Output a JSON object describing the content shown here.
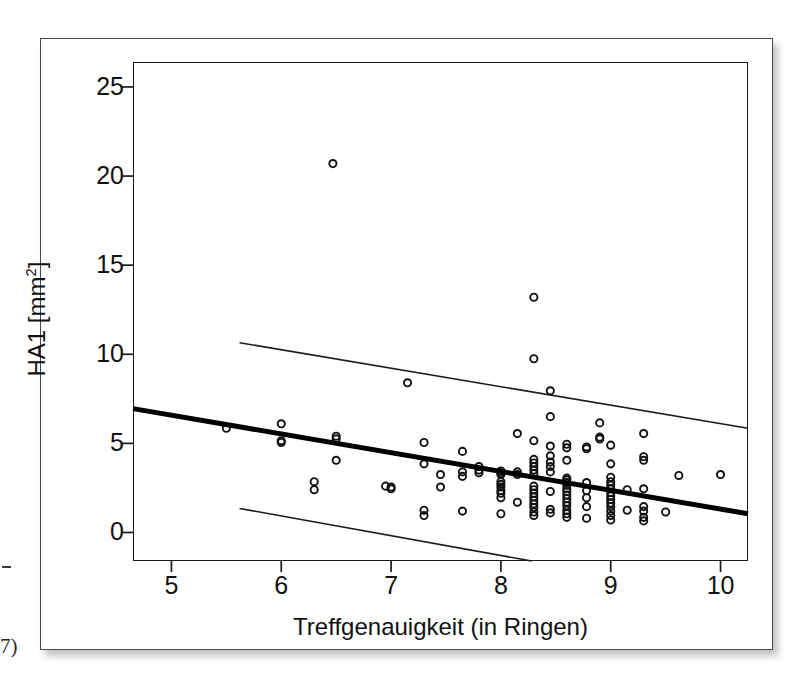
{
  "page": {
    "artifact_dash": "-",
    "artifact_note": "7)"
  },
  "chart_data": {
    "type": "scatter",
    "title": "",
    "xlabel": "Treffgenauigkeit (in Ringen)",
    "ylabel_text": "HA1 [mm",
    "ylabel_sup": "2",
    "ylabel_tail": "]",
    "ylabel_full": "HA1 [mm²]",
    "xlim": [
      4.65,
      10.25
    ],
    "ylim": [
      -1.6,
      26.4
    ],
    "xticks": [
      5,
      6,
      7,
      8,
      9,
      10
    ],
    "xtick_labels": [
      "5",
      "6",
      "7",
      "8",
      "9",
      "10"
    ],
    "yticks": [
      0,
      5,
      10,
      15,
      20,
      25
    ],
    "ytick_labels": [
      "0",
      "5",
      "10",
      "15",
      "20",
      "25"
    ],
    "grid": false,
    "legend": null,
    "marker": "open-circle",
    "regression_line": {
      "label": "regression-line",
      "x": [
        4.65,
        10.25
      ],
      "y": [
        6.95,
        1.05
      ],
      "slope": -1.054,
      "intercept": 11.85,
      "width": 5
    },
    "confidence_band_upper": {
      "label": "upper-confidence-line",
      "x": [
        5.62,
        10.25
      ],
      "y": [
        10.65,
        5.85
      ],
      "width": 1.6
    },
    "confidence_band_lower": {
      "label": "lower-confidence-line",
      "x": [
        5.62,
        8.28
      ],
      "y": [
        1.35,
        -1.6
      ],
      "width": 1.6
    },
    "points": [
      [
        5.5,
        5.85
      ],
      [
        6.0,
        6.1
      ],
      [
        6.0,
        5.15
      ],
      [
        6.0,
        5.05
      ],
      [
        6.3,
        2.85
      ],
      [
        6.3,
        2.4
      ],
      [
        6.47,
        20.7
      ],
      [
        6.5,
        5.4
      ],
      [
        6.5,
        5.25
      ],
      [
        6.5,
        4.05
      ],
      [
        6.95,
        2.6
      ],
      [
        7.0,
        2.55
      ],
      [
        7.0,
        2.45
      ],
      [
        7.15,
        8.4
      ],
      [
        7.3,
        5.05
      ],
      [
        7.3,
        3.85
      ],
      [
        7.3,
        1.25
      ],
      [
        7.3,
        0.95
      ],
      [
        7.45,
        3.25
      ],
      [
        7.45,
        2.55
      ],
      [
        7.65,
        4.55
      ],
      [
        7.65,
        3.4
      ],
      [
        7.65,
        3.15
      ],
      [
        7.65,
        1.2
      ],
      [
        7.8,
        3.7
      ],
      [
        7.8,
        3.5
      ],
      [
        7.8,
        3.35
      ],
      [
        8.0,
        3.45
      ],
      [
        8.0,
        3.35
      ],
      [
        8.0,
        3.25
      ],
      [
        8.0,
        2.85
      ],
      [
        8.0,
        2.7
      ],
      [
        8.0,
        2.55
      ],
      [
        8.0,
        2.35
      ],
      [
        8.0,
        2.2
      ],
      [
        8.0,
        1.95
      ],
      [
        8.0,
        1.05
      ],
      [
        8.15,
        5.55
      ],
      [
        8.15,
        3.4
      ],
      [
        8.15,
        3.25
      ],
      [
        8.15,
        1.7
      ],
      [
        8.3,
        13.2
      ],
      [
        8.3,
        9.75
      ],
      [
        8.3,
        5.15
      ],
      [
        8.3,
        4.1
      ],
      [
        8.3,
        3.9
      ],
      [
        8.3,
        3.7
      ],
      [
        8.3,
        3.5
      ],
      [
        8.3,
        3.3
      ],
      [
        8.3,
        2.6
      ],
      [
        8.3,
        2.4
      ],
      [
        8.3,
        2.2
      ],
      [
        8.3,
        2.0
      ],
      [
        8.3,
        1.8
      ],
      [
        8.3,
        1.6
      ],
      [
        8.3,
        1.4
      ],
      [
        8.3,
        1.15
      ],
      [
        8.3,
        0.95
      ],
      [
        8.45,
        7.95
      ],
      [
        8.45,
        6.5
      ],
      [
        8.45,
        4.85
      ],
      [
        8.45,
        4.3
      ],
      [
        8.45,
        3.95
      ],
      [
        8.45,
        3.7
      ],
      [
        8.45,
        3.4
      ],
      [
        8.45,
        2.3
      ],
      [
        8.45,
        1.3
      ],
      [
        8.45,
        1.1
      ],
      [
        8.6,
        4.95
      ],
      [
        8.6,
        4.75
      ],
      [
        8.6,
        4.05
      ],
      [
        8.6,
        3.05
      ],
      [
        8.6,
        2.95
      ],
      [
        8.6,
        2.8
      ],
      [
        8.6,
        2.65
      ],
      [
        8.6,
        2.45
      ],
      [
        8.6,
        2.3
      ],
      [
        8.6,
        2.1
      ],
      [
        8.6,
        1.9
      ],
      [
        8.6,
        1.7
      ],
      [
        8.6,
        1.5
      ],
      [
        8.6,
        1.25
      ],
      [
        8.6,
        1.05
      ],
      [
        8.6,
        0.85
      ],
      [
        8.78,
        4.8
      ],
      [
        8.78,
        4.7
      ],
      [
        8.78,
        2.8
      ],
      [
        8.78,
        2.35
      ],
      [
        8.78,
        1.95
      ],
      [
        8.78,
        1.45
      ],
      [
        8.78,
        0.8
      ],
      [
        8.9,
        6.15
      ],
      [
        8.9,
        5.35
      ],
      [
        8.9,
        5.25
      ],
      [
        9.0,
        4.9
      ],
      [
        9.0,
        3.85
      ],
      [
        9.0,
        3.1
      ],
      [
        9.0,
        2.85
      ],
      [
        9.0,
        2.65
      ],
      [
        9.0,
        2.45
      ],
      [
        9.0,
        2.25
      ],
      [
        9.0,
        2.05
      ],
      [
        9.0,
        1.85
      ],
      [
        9.0,
        1.65
      ],
      [
        9.0,
        1.45
      ],
      [
        9.0,
        1.2
      ],
      [
        9.0,
        0.95
      ],
      [
        9.0,
        0.7
      ],
      [
        9.15,
        2.4
      ],
      [
        9.15,
        1.25
      ],
      [
        9.3,
        5.55
      ],
      [
        9.3,
        4.25
      ],
      [
        9.3,
        4.05
      ],
      [
        9.3,
        2.45
      ],
      [
        9.3,
        1.45
      ],
      [
        9.3,
        1.2
      ],
      [
        9.3,
        0.85
      ],
      [
        9.3,
        0.65
      ],
      [
        9.5,
        1.15
      ],
      [
        9.62,
        3.2
      ],
      [
        10.0,
        3.25
      ]
    ]
  }
}
